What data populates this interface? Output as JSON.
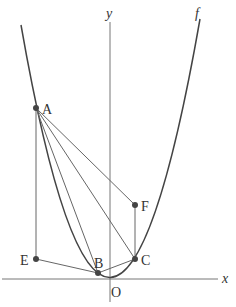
{
  "diagram": {
    "axes": {
      "x_label": "x",
      "y_label": "y",
      "origin_label": "O"
    },
    "curve": {
      "label": "f",
      "type": "parabola",
      "vertex": "O"
    },
    "points": [
      {
        "id": "A",
        "label": "A"
      },
      {
        "id": "B",
        "label": "B"
      },
      {
        "id": "C",
        "label": "C"
      },
      {
        "id": "E",
        "label": "E"
      },
      {
        "id": "F",
        "label": "F"
      }
    ],
    "segments": [
      "AE",
      "AB",
      "AC",
      "AF",
      "EB",
      "BC",
      "CF"
    ],
    "colors": {
      "line": "#555555",
      "point": "#444444",
      "background": "#ffffff"
    }
  }
}
